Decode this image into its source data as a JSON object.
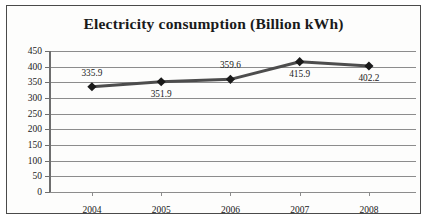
{
  "chart_data": {
    "type": "line",
    "title": "Electricity consumption (Billion kWh)",
    "xlabel": "",
    "ylabel": "",
    "categories": [
      "2004",
      "2005",
      "2006",
      "2007",
      "2008"
    ],
    "values": [
      335.9,
      351.9,
      359.6,
      415.9,
      402.2
    ],
    "data_labels": [
      "335.9",
      "351.9",
      "359.6",
      "415.9",
      "402.2"
    ],
    "data_label_positions": [
      "above",
      "below",
      "above",
      "below",
      "below"
    ],
    "ylim": [
      0,
      450
    ],
    "ytick_step": 50,
    "yticks": [
      "450",
      "400",
      "350",
      "300",
      "250",
      "200",
      "150",
      "100",
      "50",
      "0"
    ],
    "grid": true,
    "legend": false,
    "legend_position": "none",
    "series": [
      {
        "name": "Electricity consumption",
        "values": [
          335.9,
          351.9,
          359.6,
          415.9,
          402.2
        ]
      }
    ],
    "colors": {
      "line": "#4d4d4d",
      "marker": "#1a1a1a",
      "grid": "#8c8c8c",
      "axis": "#6e6e6e",
      "text": "#1a1a1a",
      "background": "#fdfdfc",
      "border": "#4a4a4a"
    }
  }
}
